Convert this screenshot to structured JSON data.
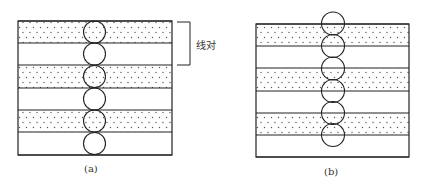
{
  "figure": {
    "panels": [
      {
        "id": "a",
        "caption": "(a)",
        "box": {
          "x": 18,
          "y": 21,
          "w": 154,
          "h": 134
        },
        "stripe_boundaries": [
          21,
          43,
          65,
          88,
          110,
          132,
          155
        ],
        "dotted_stripes": [
          0,
          2,
          4
        ],
        "circles": {
          "cx": 94.5,
          "r": 11,
          "cy": [
            32,
            54,
            76.5,
            99,
            121,
            143.5
          ]
        },
        "annotation": {
          "label": "线对",
          "bracket": {
            "x": 190,
            "y1": 22,
            "y2": 65,
            "x_tick": 177
          }
        }
      },
      {
        "id": "b",
        "caption": "(b)",
        "box": {
          "x": 256,
          "y": 24,
          "w": 153,
          "h": 133
        },
        "stripe_boundaries": [
          24,
          46,
          68,
          91,
          113,
          135,
          157
        ],
        "dotted_stripes": [
          0,
          2,
          4
        ],
        "circles": {
          "cx": 333,
          "r": 11.5,
          "cy": [
            23.5,
            46,
            68.5,
            91,
            113,
            135
          ]
        }
      }
    ],
    "colors": {
      "line": "#222222",
      "dot": "#555555",
      "background": "#ffffff"
    }
  }
}
